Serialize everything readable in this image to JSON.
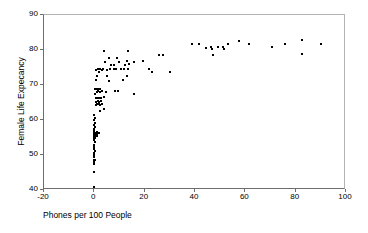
{
  "chart_data": {
    "type": "scatter",
    "title": "",
    "xlabel": "Phones per 100 People",
    "ylabel": "Female Life Expecancy",
    "xlim": [
      -20,
      100
    ],
    "ylim": [
      40,
      90
    ],
    "xticks": [
      -20,
      0,
      20,
      40,
      60,
      80,
      100
    ],
    "yticks": [
      40,
      50,
      60,
      70,
      80,
      90
    ],
    "xtick_labels": [
      "-20",
      "0",
      "20",
      "40",
      "60",
      "80",
      "100"
    ],
    "ytick_labels": [
      "40",
      "50",
      "60",
      "70",
      "80",
      "90"
    ],
    "grid": false,
    "legend": null,
    "marker": {
      "shape": "square",
      "color": "#000000",
      "size_px": 2
    },
    "series": [
      {
        "name": "Countries",
        "points": [
          [
            0.2,
            40.6
          ],
          [
            0.2,
            44.9
          ],
          [
            0.3,
            47.2
          ],
          [
            0.4,
            47.6
          ],
          [
            0.3,
            48.3
          ],
          [
            0.5,
            48.4
          ],
          [
            0.3,
            49.1
          ],
          [
            0.4,
            49.7
          ],
          [
            0.3,
            50.3
          ],
          [
            0.5,
            50.9
          ],
          [
            0.3,
            51.5
          ],
          [
            0.4,
            52.1
          ],
          [
            0.3,
            52.7
          ],
          [
            0.5,
            53.3
          ],
          [
            0.4,
            53.9
          ],
          [
            0.3,
            54.4
          ],
          [
            0.6,
            54.6
          ],
          [
            0.3,
            55.0
          ],
          [
            0.9,
            55.1
          ],
          [
            1.4,
            55.2
          ],
          [
            0.4,
            55.5
          ],
          [
            0.8,
            55.6
          ],
          [
            1.6,
            55.7
          ],
          [
            0.3,
            56.0
          ],
          [
            0.9,
            56.1
          ],
          [
            1.5,
            56.2
          ],
          [
            2.1,
            56.1
          ],
          [
            0.4,
            56.6
          ],
          [
            0.3,
            57.2
          ],
          [
            0.5,
            57.8
          ],
          [
            0.4,
            58.4
          ],
          [
            0.6,
            59.0
          ],
          [
            0.3,
            59.6
          ],
          [
            0.5,
            60.2
          ],
          [
            0.4,
            61.2
          ],
          [
            2.6,
            62.2
          ],
          [
            4.2,
            63.0
          ],
          [
            0.9,
            64.1
          ],
          [
            1.5,
            64.2
          ],
          [
            2.1,
            64.2
          ],
          [
            2.7,
            64.1
          ],
          [
            3.3,
            64.2
          ],
          [
            1.1,
            65.0
          ],
          [
            1.7,
            65.1
          ],
          [
            2.3,
            65.0
          ],
          [
            3.0,
            65.1
          ],
          [
            0.9,
            66.0
          ],
          [
            1.5,
            66.1
          ],
          [
            2.2,
            66.0
          ],
          [
            2.9,
            66.1
          ],
          [
            4.1,
            66.2
          ],
          [
            16.1,
            67.2
          ],
          [
            0.7,
            67.1
          ],
          [
            1.3,
            67.8
          ],
          [
            2.0,
            67.9
          ],
          [
            2.7,
            67.8
          ],
          [
            3.4,
            67.9
          ],
          [
            5.0,
            67.8
          ],
          [
            8.6,
            67.9
          ],
          [
            9.7,
            68.0
          ],
          [
            0.7,
            68.5
          ],
          [
            1.2,
            68.6
          ],
          [
            2.0,
            68.6
          ],
          [
            2.8,
            68.7
          ],
          [
            6.1,
            70.8
          ],
          [
            1.0,
            71.1
          ],
          [
            11.8,
            71.2
          ],
          [
            1.3,
            72.2
          ],
          [
            5.6,
            72.3
          ],
          [
            13.2,
            72.4
          ],
          [
            2.1,
            73.3
          ],
          [
            23.3,
            73.4
          ],
          [
            30.3,
            73.5
          ],
          [
            1.2,
            74.1
          ],
          [
            1.9,
            74.2
          ],
          [
            2.6,
            74.2
          ],
          [
            3.3,
            74.1
          ],
          [
            4.0,
            74.2
          ],
          [
            5.4,
            74.1
          ],
          [
            6.8,
            74.2
          ],
          [
            8.2,
            74.3
          ],
          [
            9.2,
            74.2
          ],
          [
            10.9,
            74.3
          ],
          [
            12.3,
            74.2
          ],
          [
            13.6,
            74.3
          ],
          [
            22.2,
            74.4
          ],
          [
            6.9,
            75.4
          ],
          [
            8.2,
            75.4
          ],
          [
            12.7,
            75.5
          ],
          [
            14.0,
            75.6
          ],
          [
            4.5,
            76.2
          ],
          [
            10.3,
            76.3
          ],
          [
            13.5,
            76.5
          ],
          [
            16.0,
            76.4
          ],
          [
            19.7,
            76.5
          ],
          [
            6.3,
            77.4
          ],
          [
            9.6,
            77.5
          ],
          [
            26.2,
            78.3
          ],
          [
            27.6,
            78.3
          ],
          [
            47.4,
            78.4
          ],
          [
            82.8,
            78.5
          ],
          [
            4.4,
            79.3
          ],
          [
            13.9,
            79.3
          ],
          [
            47.0,
            79.9
          ],
          [
            52.1,
            79.9
          ],
          [
            44.8,
            80.4
          ],
          [
            46.6,
            80.5
          ],
          [
            49.5,
            80.5
          ],
          [
            51.6,
            80.5
          ],
          [
            70.9,
            80.5
          ],
          [
            39.2,
            81.4
          ],
          [
            41.9,
            81.4
          ],
          [
            53.5,
            81.3
          ],
          [
            61.9,
            81.4
          ],
          [
            76.3,
            81.4
          ],
          [
            90.6,
            81.4
          ],
          [
            57.9,
            82.2
          ],
          [
            82.9,
            82.6
          ]
        ]
      }
    ]
  }
}
